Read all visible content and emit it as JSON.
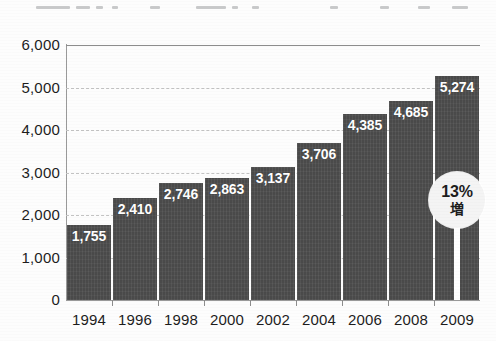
{
  "chart_data": {
    "type": "bar",
    "title": "",
    "xlabel": "",
    "ylabel": "",
    "categories": [
      "1994",
      "1996",
      "1998",
      "2000",
      "2002",
      "2004",
      "2006",
      "2008",
      "2009"
    ],
    "values": [
      1755,
      2410,
      2746,
      2863,
      3137,
      3706,
      4385,
      4685,
      5274
    ],
    "value_labels": [
      "1,755",
      "2,410",
      "2,746",
      "2,863",
      "3,137",
      "3,706",
      "4,385",
      "4,685",
      "5,274"
    ],
    "ylim": [
      0,
      6000
    ],
    "ytick_labels": [
      "6,000",
      "5,000",
      "4,000",
      "3,000",
      "2,000",
      "1,000",
      "0"
    ],
    "ytick_values": [
      6000,
      5000,
      4000,
      3000,
      2000,
      1000,
      0
    ],
    "grid": true,
    "legend": "none",
    "bar_color": "#4a4a4a",
    "annotations": [
      {
        "target_category": "2009",
        "percent": "13%",
        "sub": "増"
      }
    ]
  },
  "colors": {
    "background": "#fdfdfd",
    "bar": "#4a4a4a",
    "axis": "#9a9a9a",
    "grid": "#c3c3c3",
    "text": "#1d1d1d",
    "value_label": "#ffffff",
    "callout_fill": "#f4f4f4"
  }
}
